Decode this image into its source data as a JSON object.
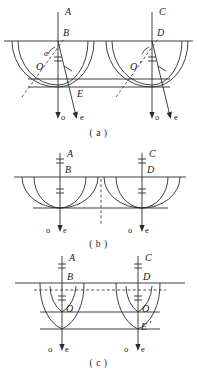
{
  "figure": {
    "title_implicit": "Double refraction ray diagrams",
    "stroke_color": "#2b2b2b",
    "dash_color": "#444444",
    "panels": [
      {
        "id": "a",
        "caption": "( a )",
        "labels": {
          "left_top_axis": "A",
          "left_surface_point": "B",
          "left_center": "O",
          "left_lower_point": "E",
          "right_top_axis": "C",
          "right_surface_point": "D",
          "right_center": "O",
          "right_center_prime": "'",
          "angle": "α",
          "ordinary_ray": "o",
          "extraordinary_ray": "e"
        },
        "ray_labels_left": [
          "o",
          "e"
        ],
        "ray_labels_right": [
          "o",
          "e"
        ]
      },
      {
        "id": "b",
        "caption": "( b )",
        "labels": {
          "left_top_axis": "A",
          "left_surface_point": "B",
          "right_top_axis": "C",
          "right_surface_point": "D",
          "ordinary_ray": "o",
          "extraordinary_ray": "e"
        },
        "ray_labels_left": [
          "o",
          "e"
        ],
        "ray_labels_right": [
          "o",
          "e"
        ]
      },
      {
        "id": "c",
        "caption": "( c )",
        "labels": {
          "left_top_axis": "A",
          "left_surface_point": "B",
          "left_center": "O",
          "right_top_axis": "C",
          "right_surface_point": "D",
          "right_center": "O",
          "right_lower_point": "E",
          "right_lower_point_prime": "'",
          "ordinary_ray": "o",
          "extraordinary_ray": "e"
        },
        "ray_labels_left": [
          "o",
          "e"
        ],
        "ray_labels_right": [
          "o",
          "e"
        ]
      }
    ]
  }
}
